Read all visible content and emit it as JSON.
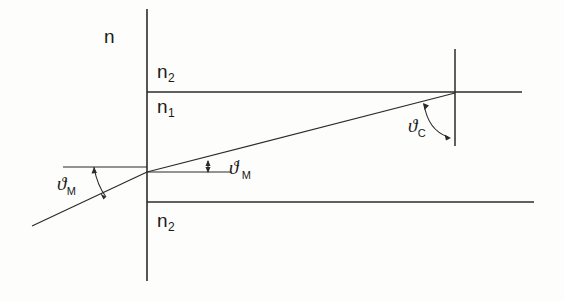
{
  "figure": {
    "kind": "refractive-index-profile-ray-diagram",
    "background_color": "#fdfdfb",
    "line_color": "#2b2b2b"
  },
  "axis": {
    "vertical_label": "n",
    "vertical_label_name": "index-axis-label"
  },
  "labels": {
    "n_top": {
      "base": "n",
      "sub": "2"
    },
    "n_core": {
      "base": "n",
      "sub": "1"
    },
    "n_bottom": {
      "base": "n",
      "sub": "2"
    },
    "theta_m": {
      "base": "ϑ",
      "sub": "M",
      "prime": ""
    },
    "theta_m_prime": {
      "base": "ϑ",
      "sub": "M",
      "prime": "′"
    },
    "theta_c": {
      "base": "ϑ",
      "sub": "C",
      "prime": ""
    }
  },
  "geometry": {
    "axis_vertical_x": 147,
    "axis_vertical_y1": 9,
    "axis_vertical_y2": 281,
    "cladding_top_line_y": 92,
    "cladding_bottom_line_y": 202,
    "horizontal_line_x_start": 147,
    "horizontal_line_x_end": 522,
    "right_boundary_x": 455,
    "right_boundary_y1": 49,
    "right_boundary_y2": 146,
    "ray_entry_point": [
      147,
      172
    ],
    "ray_left_end": [
      32,
      226
    ],
    "ray_exit_point": [
      455,
      93
    ],
    "reference_line_left": [
      63,
      167
    ],
    "reference_line_right": [
      232,
      172
    ]
  }
}
